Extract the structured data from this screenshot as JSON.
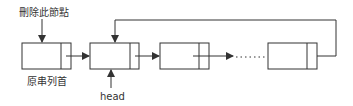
{
  "diagram": {
    "labels": {
      "delete_node": "刪除此節點",
      "original_head": "原串列首",
      "head": "head"
    },
    "nodes": [
      {
        "id": "node-1",
        "x": 22,
        "y": 43,
        "w": 49,
        "h": 26,
        "divider_x": 61
      },
      {
        "id": "node-2",
        "x": 90,
        "y": 43,
        "w": 49,
        "h": 26,
        "divider_x": 130
      },
      {
        "id": "node-3",
        "x": 160,
        "y": 43,
        "w": 49,
        "h": 26,
        "divider_x": 199
      },
      {
        "id": "node-4",
        "x": 268,
        "y": 43,
        "w": 49,
        "h": 26,
        "divider_x": 307
      }
    ],
    "ellipsis": "......",
    "colors": {
      "stroke": "#333333",
      "background": "#ffffff"
    }
  }
}
